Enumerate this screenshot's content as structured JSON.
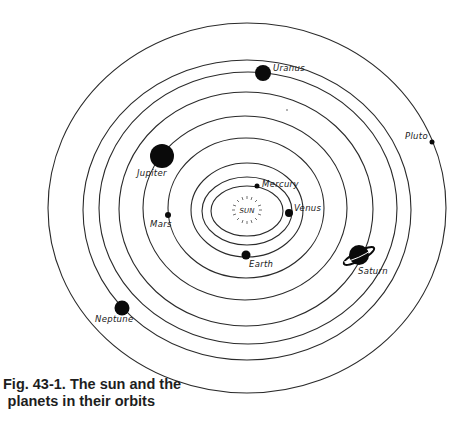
{
  "figure": {
    "caption_line1": "Fig. 43-1. The sun and the",
    "caption_line2": "planets in their orbits"
  },
  "sun": {
    "label": "SUN"
  },
  "planets": [
    {
      "name": "Mercury",
      "label": "Mercury"
    },
    {
      "name": "Venus",
      "label": "Venus"
    },
    {
      "name": "Earth",
      "label": "Earth"
    },
    {
      "name": "Mars",
      "label": "Mars"
    },
    {
      "name": "Jupiter",
      "label": "Jupiter"
    },
    {
      "name": "Saturn",
      "label": "Saturn"
    },
    {
      "name": "Uranus",
      "label": "Uranus"
    },
    {
      "name": "Neptune",
      "label": "Neptune"
    },
    {
      "name": "Pluto",
      "label": "Pluto"
    }
  ],
  "colors": {
    "ink": "#0a0a0a",
    "background": "#ffffff"
  }
}
